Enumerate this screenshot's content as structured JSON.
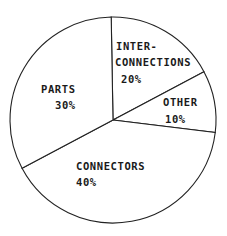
{
  "chart_data": {
    "type": "pie",
    "title": "",
    "slices": [
      {
        "label": "INTER-CONNECTIONS",
        "value": 20,
        "display_lines": [
          "INTER-",
          "CONNECTIONS"
        ],
        "pct_label": "20%"
      },
      {
        "label": "OTHER",
        "value": 10,
        "display_lines": [
          "OTHER"
        ],
        "pct_label": "10%"
      },
      {
        "label": "CONNECTORS",
        "value": 40,
        "display_lines": [
          "CONNECTORS"
        ],
        "pct_label": "40%"
      },
      {
        "label": "PARTS",
        "value": 30,
        "display_lines": [
          "PARTS"
        ],
        "pct_label": "30%"
      }
    ],
    "start_angle_deg": -90,
    "direction": "clockwise",
    "fill": "#ffffff",
    "stroke": "#222222",
    "legend": "none",
    "labels_inside": true
  },
  "labels": {
    "inter_line1": "INTER-",
    "inter_line2": "CONNECTIONS",
    "inter_pct": "20%",
    "other_name": "OTHER",
    "other_pct": "10%",
    "connectors_name": "CONNECTORS",
    "connectors_pct": "40%",
    "parts_name": "PARTS",
    "parts_pct": "30%"
  }
}
